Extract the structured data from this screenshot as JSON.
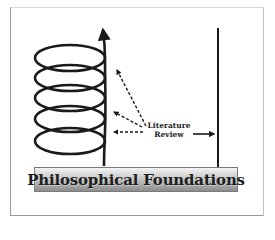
{
  "diagram": {
    "banner": {
      "label": "Philosophical Foundations"
    },
    "annotation": {
      "line1": "Literature",
      "line2": "Review"
    },
    "elements": {
      "coil": {
        "loops": 5,
        "description": "upward spiral with arrowhead at top"
      },
      "dashed_arrows": 3,
      "solid_arrow": "points right to vertical line",
      "vertical_line": "right boundary"
    },
    "colors": {
      "stroke": "#1a1a1a",
      "banner_light": "#f4f4f4",
      "banner_dark": "#8c8c8c"
    }
  }
}
